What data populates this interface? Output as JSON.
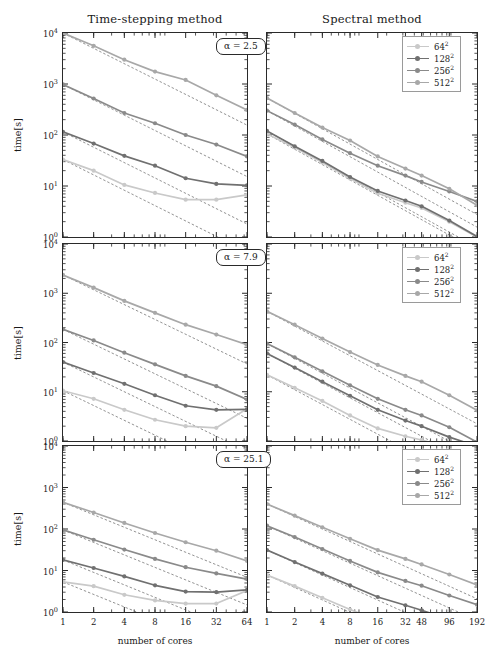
{
  "figure": {
    "column_titles": [
      "Time-stepping method",
      "Spectral method"
    ],
    "ylabel": "time[s]",
    "xlabel": "number of cores"
  },
  "legend": {
    "entries": [
      {
        "label": "64",
        "exp": "2",
        "color": "#c9c9c9"
      },
      {
        "label": "128",
        "exp": "2",
        "color": "#707070"
      },
      {
        "label": "256",
        "exp": "2",
        "color": "#8a8a8a"
      },
      {
        "label": "512",
        "exp": "2",
        "color": "#a8a8a8"
      }
    ]
  },
  "rows": [
    {
      "alpha_label": "α = 2.5"
    },
    {
      "alpha_label": "α = 7.9"
    },
    {
      "alpha_label": "α = 25.1"
    }
  ],
  "axes": {
    "y_ticks": [
      {
        "base": "10",
        "exp": "0",
        "value": 1
      },
      {
        "base": "10",
        "exp": "1",
        "value": 10
      },
      {
        "base": "10",
        "exp": "2",
        "value": 100
      },
      {
        "base": "10",
        "exp": "3",
        "value": 1000
      },
      {
        "base": "10",
        "exp": "4",
        "value": 10000
      }
    ],
    "ylim": [
      1,
      10000
    ],
    "x_ticks_left": [
      "1",
      "2",
      "4",
      "8",
      "16",
      "32",
      "64"
    ],
    "x_values_left": [
      1,
      2,
      4,
      8,
      16,
      32,
      64
    ],
    "xlim_left": [
      1,
      64
    ],
    "x_ticks_right": [
      "1",
      "2",
      "4",
      "8",
      "16",
      "32",
      "48",
      "96",
      "192"
    ],
    "x_values_right": [
      1,
      2,
      4,
      8,
      16,
      32,
      48,
      96,
      192
    ],
    "xlim_right": [
      1,
      192
    ],
    "scale": "log-log",
    "grid": false
  },
  "chart_data": [
    {
      "type": "line",
      "panel": "row1-left",
      "title": "Time-stepping method",
      "annotation": "α = 2.5",
      "xlabel": "number of cores",
      "ylabel": "time[s]",
      "xscale": "log",
      "yscale": "log",
      "xlim": [
        1,
        64
      ],
      "ylim": [
        1,
        10000
      ],
      "x": [
        1,
        2,
        4,
        8,
        16,
        32,
        64
      ],
      "series": [
        {
          "name": "64²",
          "color": "#c9c9c9",
          "values": [
            33,
            20,
            10.5,
            7.3,
            5.4,
            5.4,
            6.7
          ]
        },
        {
          "name": "128²",
          "color": "#707070",
          "values": [
            115,
            68,
            39,
            25,
            14.2,
            11,
            10.3
          ]
        },
        {
          "name": "256²",
          "color": "#8a8a8a",
          "values": [
            980,
            520,
            270,
            170,
            100,
            65,
            38
          ]
        },
        {
          "name": "512²",
          "color": "#a8a8a8",
          "values": [
            10000,
            5600,
            3000,
            1750,
            1200,
            600,
            310
          ]
        }
      ],
      "ideal_scaling_lines": 4
    },
    {
      "type": "line",
      "panel": "row1-right",
      "title": "Spectral method",
      "annotation": "α = 2.5",
      "xlabel": "number of cores",
      "ylabel": "time[s]",
      "xscale": "log",
      "yscale": "log",
      "xlim": [
        1,
        192
      ],
      "ylim": [
        1,
        10000
      ],
      "x": [
        1,
        2,
        4,
        8,
        16,
        32,
        48,
        96,
        192
      ],
      "series": [
        {
          "name": "64²",
          "color": "#c9c9c9",
          "values": [
            105,
            57,
            29,
            14,
            7.2,
            4.7,
            3.7,
            2.0,
            1.0
          ]
        },
        {
          "name": "128²",
          "color": "#707070",
          "values": [
            120,
            60,
            31,
            15,
            8.0,
            5.2,
            4.0,
            2.1,
            1.02
          ]
        },
        {
          "name": "256²",
          "color": "#8a8a8a",
          "values": [
            300,
            160,
            82,
            44,
            25,
            16,
            12,
            7.8,
            5.0
          ]
        },
        {
          "name": "512²",
          "color": "#a8a8a8",
          "values": [
            530,
            270,
            140,
            78,
            38,
            22,
            16,
            8.8,
            4.2
          ]
        }
      ],
      "ideal_scaling_lines": 4
    },
    {
      "type": "line",
      "panel": "row2-left",
      "title": "Time-stepping method",
      "annotation": "α = 7.9",
      "xlabel": "number of cores",
      "ylabel": "time[s]",
      "xscale": "log",
      "yscale": "log",
      "xlim": [
        1,
        64
      ],
      "ylim": [
        1,
        10000
      ],
      "x": [
        1,
        2,
        4,
        8,
        16,
        32,
        64
      ],
      "series": [
        {
          "name": "64²",
          "color": "#c9c9c9",
          "values": [
            10.5,
            7.2,
            4.3,
            2.7,
            2.0,
            1.85,
            4.5
          ]
        },
        {
          "name": "128²",
          "color": "#707070",
          "values": [
            40,
            24,
            14.5,
            8.5,
            5.2,
            4.3,
            4.4
          ]
        },
        {
          "name": "256²",
          "color": "#8a8a8a",
          "values": [
            185,
            110,
            62,
            36,
            21,
            13,
            7.0
          ]
        },
        {
          "name": "512²",
          "color": "#a8a8a8",
          "values": [
            2350,
            1300,
            700,
            400,
            230,
            145,
            90
          ]
        }
      ],
      "ideal_scaling_lines": 4
    },
    {
      "type": "line",
      "panel": "row2-right",
      "title": "Spectral method",
      "annotation": "α = 7.9",
      "xlabel": "number of cores",
      "ylabel": "time[s]",
      "xscale": "log",
      "yscale": "log",
      "xlim": [
        1,
        192
      ],
      "ylim": [
        1,
        10000
      ],
      "x": [
        1,
        2,
        4,
        8,
        16,
        32,
        48,
        96,
        192
      ],
      "series": [
        {
          "name": "64²",
          "color": "#c9c9c9",
          "values": [
            22,
            12,
            6.5,
            3.3,
            1.8,
            1.25,
            1.05,
            0.72,
            0.62
          ]
        },
        {
          "name": "128²",
          "color": "#707070",
          "values": [
            60,
            31,
            16,
            8.3,
            4.3,
            2.6,
            2.0,
            1.2,
            0.78
          ]
        },
        {
          "name": "256²",
          "color": "#8a8a8a",
          "values": [
            95,
            50,
            26,
            13.5,
            7.2,
            4.3,
            3.3,
            1.9,
            0.95
          ]
        },
        {
          "name": "512²",
          "color": "#a8a8a8",
          "values": [
            430,
            230,
            120,
            64,
            35,
            21,
            16,
            8.5,
            4.2
          ]
        }
      ],
      "ideal_scaling_lines": 4
    },
    {
      "type": "line",
      "panel": "row3-left",
      "title": "Time-stepping method",
      "annotation": "α = 25.1",
      "xlabel": "number of cores",
      "ylabel": "time[s]",
      "xscale": "log",
      "yscale": "log",
      "xlim": [
        1,
        64
      ],
      "ylim": [
        1,
        10000
      ],
      "x": [
        1,
        2,
        4,
        8,
        16,
        32,
        64
      ],
      "series": [
        {
          "name": "64²",
          "color": "#c9c9c9",
          "values": [
            5.3,
            4.2,
            2.6,
            1.9,
            1.6,
            1.6,
            3.3
          ]
        },
        {
          "name": "128²",
          "color": "#707070",
          "values": [
            18,
            11.5,
            7.2,
            4.4,
            3.1,
            3.0,
            3.4
          ]
        },
        {
          "name": "256²",
          "color": "#8a8a8a",
          "values": [
            95,
            55,
            32,
            19,
            12,
            8.5,
            6.2
          ]
        },
        {
          "name": "512²",
          "color": "#a8a8a8",
          "values": [
            440,
            250,
            140,
            80,
            48,
            30,
            17
          ]
        }
      ],
      "ideal_scaling_lines": 4
    },
    {
      "type": "line",
      "panel": "row3-right",
      "title": "Spectral method",
      "annotation": "α = 25.1",
      "xlabel": "number of cores",
      "ylabel": "time[s]",
      "xscale": "log",
      "yscale": "log",
      "xlim": [
        1,
        192
      ],
      "ylim": [
        1,
        10000
      ],
      "x": [
        1,
        2,
        4,
        8,
        16,
        32,
        48,
        96,
        192
      ],
      "series": [
        {
          "name": "64²",
          "color": "#c9c9c9",
          "values": [
            7.8,
            4.2,
            2.2,
            1.15,
            0.62,
            0.4,
            0.32,
            0.18,
            0.1
          ]
        },
        {
          "name": "128²",
          "color": "#707070",
          "values": [
            31,
            16,
            8.4,
            4.4,
            2.3,
            1.45,
            1.1,
            0.66,
            0.4
          ]
        },
        {
          "name": "256²",
          "color": "#8a8a8a",
          "values": [
            120,
            64,
            33,
            17,
            9.0,
            5.6,
            4.3,
            2.5,
            1.5
          ]
        },
        {
          "name": "512²",
          "color": "#a8a8a8",
          "values": [
            400,
            210,
            110,
            58,
            31,
            19,
            14,
            8.0,
            4.5
          ]
        }
      ],
      "ideal_scaling_lines": 4
    }
  ]
}
